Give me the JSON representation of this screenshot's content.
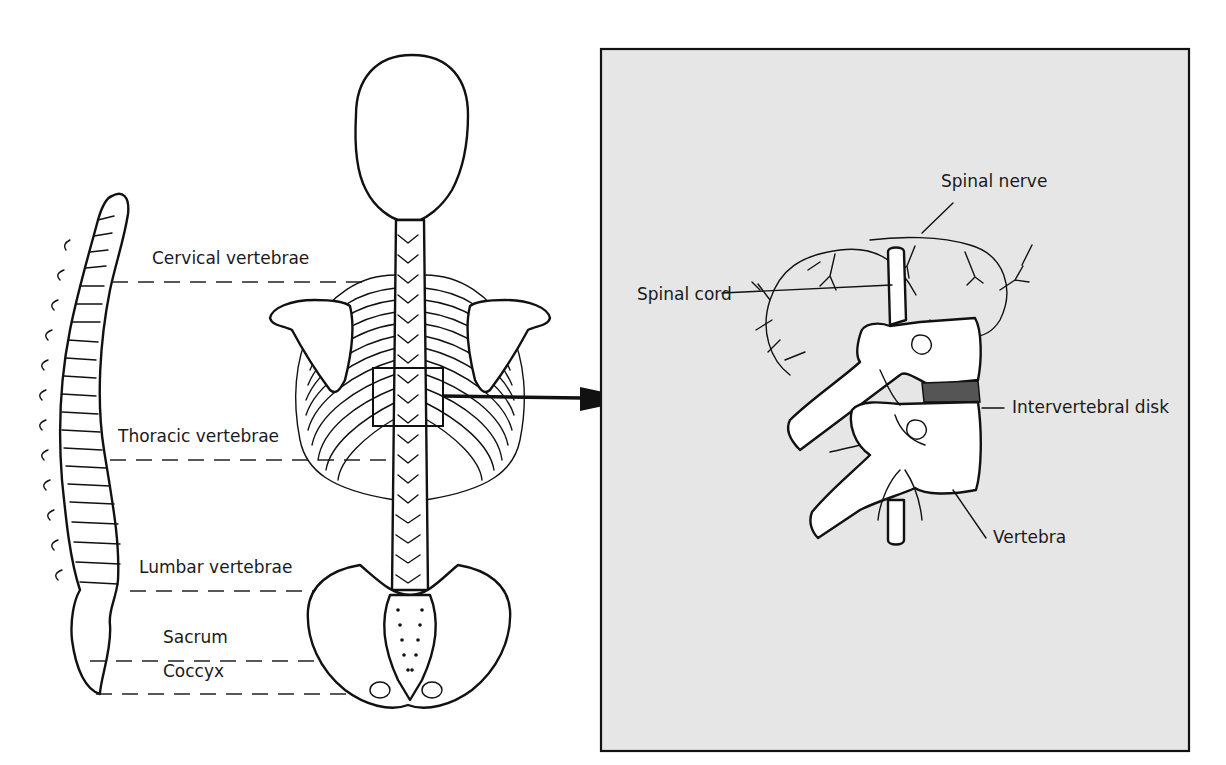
{
  "figure": {
    "type": "anatomical-diagram",
    "colors": {
      "background": "#ffffff",
      "inset_background": "#e6e6e6",
      "line": "#111111",
      "disk": "#555555"
    }
  },
  "left_panel": {
    "regions": [
      {
        "label": "Cervical vertebrae",
        "line_y": 282
      },
      {
        "label": "Thoracic vertebrae",
        "line_y": 460
      },
      {
        "label": "Lumbar vertebrae",
        "line_y": 591
      },
      {
        "label": "Sacrum",
        "line_y": 661
      },
      {
        "label": "Coccyx",
        "line_y": 694
      }
    ]
  },
  "inset": {
    "labels": {
      "spinal_nerve": "Spinal nerve",
      "spinal_cord": "Spinal cord",
      "intervertebral_disk": "Intervertebral disk",
      "vertebra": "Vertebra"
    }
  }
}
